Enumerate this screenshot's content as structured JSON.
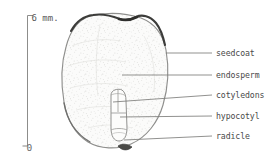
{
  "figure": {
    "style": "pencil-botanical-drawing"
  },
  "scale_bar": {
    "top_label": "6 mm.",
    "bottom_label": "0",
    "orientation": "vertical"
  },
  "labels": [
    {
      "id": "seedcoat",
      "text": "seedcoat"
    },
    {
      "id": "endosperm",
      "text": "endosperm"
    },
    {
      "id": "cotyledons",
      "text": "cotyledons"
    },
    {
      "id": "hypocotyl",
      "text": "hypocotyl"
    },
    {
      "id": "radicle",
      "text": "radicle"
    }
  ],
  "colors": {
    "ink": "#4a4a4a",
    "seedcoat_dark": "#3a3a38",
    "outline": "#8a8a88",
    "fill": "#fbfbfa",
    "stipple": "#c9c9c6",
    "leader": "#7d7d7b",
    "background": "#ffffff"
  }
}
